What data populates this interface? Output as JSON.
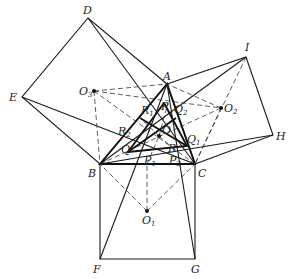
{
  "figure": {
    "type": "geometry-diagram",
    "points": {
      "A": {
        "label": "A",
        "x": 167,
        "y": 84
      },
      "B": {
        "label": "B",
        "x": 100,
        "y": 164
      },
      "C": {
        "label": "C",
        "x": 195,
        "y": 164
      },
      "D": {
        "label": "D",
        "x": 88,
        "y": 18
      },
      "E": {
        "label": "E",
        "x": 22,
        "y": 97
      },
      "F": {
        "label": "F",
        "x": 100,
        "y": 259
      },
      "G": {
        "label": "G",
        "x": 195,
        "y": 259
      },
      "H": {
        "label": "H",
        "x": 273,
        "y": 135
      },
      "I": {
        "label": "I",
        "x": 246,
        "y": 57
      },
      "O1": {
        "label": "O",
        "sub": "1",
        "x": 147,
        "y": 211
      },
      "O2": {
        "label": "O",
        "sub": "2",
        "x": 221,
        "y": 108
      },
      "O3": {
        "label": "O",
        "sub": "3",
        "x": 94,
        "y": 91
      },
      "O": {
        "label": "O",
        "x": 159,
        "y": 136
      }
    },
    "inner_labels": [
      {
        "label": "P",
        "sub": "",
        "x": 163,
        "y": 107
      },
      {
        "label": "Q",
        "sub": "2",
        "x": 176,
        "y": 108
      },
      {
        "label": "R",
        "sub": "1",
        "x": 144,
        "y": 110
      },
      {
        "label": "R",
        "sub": "2",
        "x": 120,
        "y": 131
      },
      {
        "label": "O",
        "sub": "",
        "x": 162,
        "y": 133
      },
      {
        "label": "R",
        "sub": "",
        "x": 168,
        "y": 149
      },
      {
        "label": "Q",
        "sub": "",
        "x": 124,
        "y": 150
      },
      {
        "label": "Q",
        "sub": "1",
        "x": 189,
        "y": 141
      },
      {
        "label": "P",
        "sub": "1",
        "x": 146,
        "y": 164
      },
      {
        "label": "P",
        "sub": "2",
        "x": 171,
        "y": 165
      }
    ]
  }
}
